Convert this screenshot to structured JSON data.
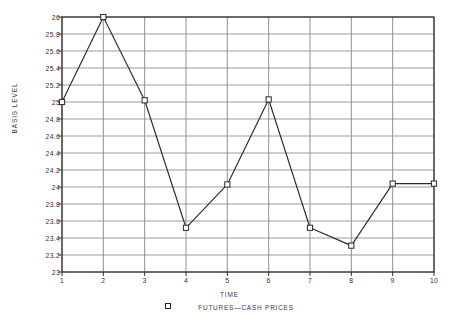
{
  "chart_data": {
    "type": "line",
    "title": "",
    "xlabel": "TIME",
    "ylabel": "BASIS LEVEL",
    "x": [
      1,
      2,
      3,
      4,
      5,
      6,
      7,
      8,
      9,
      10
    ],
    "xticklabels": [
      "1",
      "2",
      "3",
      "4",
      "5",
      "6",
      "7",
      "8",
      "9",
      "10"
    ],
    "xlim": [
      1,
      10
    ],
    "ylim": [
      23,
      26
    ],
    "yticks": [
      23,
      23.2,
      23.4,
      23.6,
      23.8,
      24,
      24.2,
      24.4,
      24.6,
      24.8,
      25,
      25.2,
      25.4,
      25.6,
      25.8,
      26
    ],
    "yticklabels": [
      "23",
      "23.2",
      "23.4",
      "23.6",
      "23.8",
      "24",
      "24.2",
      "24.4",
      "24.6",
      "24.8",
      "25",
      "25.2",
      "25.4",
      "25.6",
      "25.8",
      "26"
    ],
    "grid": true,
    "legend_position": "below-axes",
    "series": [
      {
        "name": "FUTURES-CASH PRICES",
        "marker": "open-square",
        "line_color": "#2a2a2a",
        "values": [
          25.0,
          26.0,
          25.02,
          23.52,
          24.03,
          25.03,
          23.52,
          23.31,
          24.04,
          24.04
        ]
      }
    ]
  },
  "legend": {
    "marker_name": "open-square-marker",
    "label": "FUTURES—CASH PRICES"
  },
  "colors": {
    "grid": "#8a8a8a",
    "axis": "#2f2f2f",
    "line": "#2a2a2a",
    "text": "#303030",
    "background": "#ffffff"
  }
}
